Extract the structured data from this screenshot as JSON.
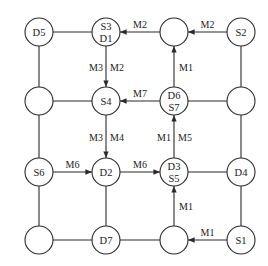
{
  "diagram": {
    "title": "",
    "node_radius": 14,
    "columns": [
      39,
      106,
      174,
      241
    ],
    "rows": [
      32,
      101,
      172,
      240
    ],
    "nodes": [
      {
        "id": "n00",
        "col": 0,
        "row": 0,
        "labels": [
          "D5"
        ]
      },
      {
        "id": "n10",
        "col": 1,
        "row": 0,
        "labels": [
          "S3",
          "D1"
        ]
      },
      {
        "id": "n20",
        "col": 2,
        "row": 0,
        "labels": []
      },
      {
        "id": "n30",
        "col": 3,
        "row": 0,
        "labels": [
          "S2"
        ]
      },
      {
        "id": "n01",
        "col": 0,
        "row": 1,
        "labels": []
      },
      {
        "id": "n11",
        "col": 1,
        "row": 1,
        "labels": [
          "S4"
        ]
      },
      {
        "id": "n21",
        "col": 2,
        "row": 1,
        "labels": [
          "D6",
          "S7"
        ]
      },
      {
        "id": "n31",
        "col": 3,
        "row": 1,
        "labels": []
      },
      {
        "id": "n02",
        "col": 0,
        "row": 2,
        "labels": [
          "S6"
        ]
      },
      {
        "id": "n12",
        "col": 1,
        "row": 2,
        "labels": [
          "D2"
        ]
      },
      {
        "id": "n22",
        "col": 2,
        "row": 2,
        "labels": [
          "D3",
          "S5"
        ]
      },
      {
        "id": "n32",
        "col": 3,
        "row": 2,
        "labels": [
          "D4"
        ]
      },
      {
        "id": "n03",
        "col": 0,
        "row": 3,
        "labels": []
      },
      {
        "id": "n13",
        "col": 1,
        "row": 3,
        "labels": [
          "D7"
        ]
      },
      {
        "id": "n23",
        "col": 2,
        "row": 3,
        "labels": []
      },
      {
        "id": "n33",
        "col": 3,
        "row": 3,
        "labels": [
          "S1"
        ]
      }
    ],
    "edges": [
      {
        "from": "n00",
        "to": "n10",
        "directed": false,
        "labels": []
      },
      {
        "from": "n20",
        "to": "n10",
        "directed": true,
        "labels": [
          "M2"
        ]
      },
      {
        "from": "n30",
        "to": "n20",
        "directed": true,
        "labels": [
          "M2"
        ]
      },
      {
        "from": "n01",
        "to": "n11",
        "directed": false,
        "labels": []
      },
      {
        "from": "n21",
        "to": "n11",
        "directed": true,
        "labels": [
          "M7"
        ]
      },
      {
        "from": "n21",
        "to": "n31",
        "directed": false,
        "labels": []
      },
      {
        "from": "n02",
        "to": "n12",
        "directed": true,
        "labels": [
          "M6"
        ]
      },
      {
        "from": "n12",
        "to": "n22",
        "directed": true,
        "labels": [
          "M6"
        ]
      },
      {
        "from": "n22",
        "to": "n32",
        "directed": false,
        "labels": []
      },
      {
        "from": "n03",
        "to": "n13",
        "directed": false,
        "labels": []
      },
      {
        "from": "n13",
        "to": "n23",
        "directed": false,
        "labels": []
      },
      {
        "from": "n33",
        "to": "n23",
        "directed": true,
        "labels": [
          "M1"
        ]
      },
      {
        "from": "n00",
        "to": "n01",
        "directed": false,
        "labels": []
      },
      {
        "from": "n01",
        "to": "n02",
        "directed": false,
        "labels": []
      },
      {
        "from": "n02",
        "to": "n03",
        "directed": false,
        "labels": []
      },
      {
        "from": "n10",
        "to": "n11",
        "directed": true,
        "labels": [
          "M3",
          "M2"
        ]
      },
      {
        "from": "n11",
        "to": "n12",
        "directed": true,
        "labels": [
          "M3",
          "M4"
        ]
      },
      {
        "from": "n12",
        "to": "n13",
        "directed": false,
        "labels": []
      },
      {
        "from": "n21",
        "to": "n20",
        "directed": true,
        "labels": [
          "M1"
        ]
      },
      {
        "from": "n22",
        "to": "n21",
        "directed": true,
        "labels": [
          "M1",
          "M5"
        ]
      },
      {
        "from": "n23",
        "to": "n22",
        "directed": true,
        "labels": [
          "M1"
        ]
      },
      {
        "from": "n30",
        "to": "n31",
        "directed": false,
        "labels": []
      },
      {
        "from": "n31",
        "to": "n32",
        "directed": false,
        "labels": []
      },
      {
        "from": "n32",
        "to": "n33",
        "directed": false,
        "labels": []
      }
    ],
    "colors": {
      "stroke": "#2a2a2a",
      "text": "#1a1a1a",
      "background": "#ffffff"
    }
  }
}
